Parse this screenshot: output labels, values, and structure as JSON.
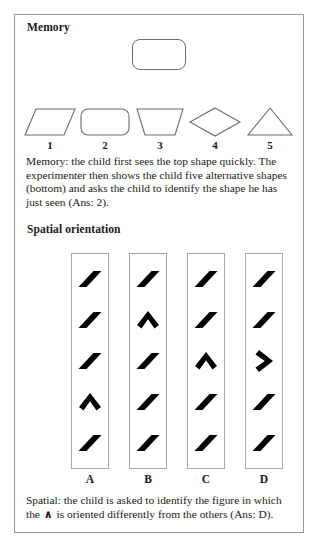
{
  "memory": {
    "heading": "Memory",
    "target_shape": "rounded-rectangle",
    "options": [
      {
        "label": "1",
        "shape": "parallelogram"
      },
      {
        "label": "2",
        "shape": "rounded-rectangle"
      },
      {
        "label": "3",
        "shape": "trapezoid"
      },
      {
        "label": "4",
        "shape": "diamond"
      },
      {
        "label": "5",
        "shape": "triangle"
      }
    ],
    "caption": "Memory: the child first sees the top shape quickly. The experimenter then shows the child five alternative shapes (bottom) and asks the child to identify the shape he has just seen (Ans: 2)."
  },
  "spatial": {
    "heading": "Spatial orientation",
    "columns": [
      {
        "label": "A",
        "cells": [
          "slash",
          "slash",
          "slash",
          "chevron-up",
          "slash"
        ]
      },
      {
        "label": "B",
        "cells": [
          "slash",
          "chevron-up",
          "slash",
          "slash",
          "slash"
        ]
      },
      {
        "label": "C",
        "cells": [
          "slash",
          "slash",
          "chevron-up",
          "slash",
          "slash"
        ]
      },
      {
        "label": "D",
        "cells": [
          "slash",
          "slash",
          "chevron-right",
          "slash",
          "slash"
        ]
      }
    ],
    "caption_before": "Spatial: the child is asked to identify the figure in which the",
    "caption_glyph": "∧",
    "caption_after": "is oriented differently from the others (Ans: D)."
  },
  "colors": {
    "frame_border": "#9a9a9a",
    "shape_outline": "#6d6d6d",
    "glyph_fill": "#000000",
    "text": "#1a1a1a",
    "background": "#ffffff"
  }
}
